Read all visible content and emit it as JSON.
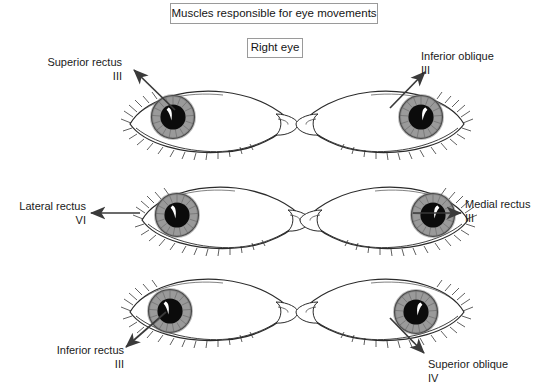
{
  "header": {
    "title": "Muscles responsible for eye movements",
    "subtitle": "Right eye"
  },
  "diagram": {
    "type": "anatomical-illustration",
    "subject": "right eye",
    "grid": {
      "rows": 3,
      "columns": 2
    },
    "panels": [
      {
        "id": "superior-rectus",
        "muscle": "Superior rectus",
        "nerve": "III",
        "direction": "up-left",
        "label_align": "right",
        "eye_orientation": "nasal-right",
        "gaze": "up-and-out"
      },
      {
        "id": "inferior-oblique",
        "muscle": "Inferior oblique",
        "nerve": "III",
        "direction": "up-right",
        "label_align": "left",
        "eye_orientation": "nasal-left",
        "gaze": "up-and-out"
      },
      {
        "id": "lateral-rectus",
        "muscle": "Lateral rectus",
        "nerve": "VI",
        "direction": "left",
        "label_align": "right",
        "eye_orientation": "nasal-right",
        "gaze": "out"
      },
      {
        "id": "medial-rectus",
        "muscle": "Medial rectus",
        "nerve": "III",
        "direction": "right",
        "label_align": "left",
        "eye_orientation": "nasal-left",
        "gaze": "in"
      },
      {
        "id": "inferior-rectus",
        "muscle": "Inferior rectus",
        "nerve": "III",
        "direction": "down-left",
        "label_align": "right",
        "eye_orientation": "nasal-right",
        "gaze": "down-and-out"
      },
      {
        "id": "superior-oblique",
        "muscle": "Superior oblique",
        "nerve": "IV",
        "direction": "down-right",
        "label_align": "left",
        "eye_orientation": "nasal-left",
        "gaze": "down-and-in"
      }
    ]
  },
  "colors": {
    "background": "#ffffff",
    "ink": "#1a1a1a",
    "outline": "#2b2b2b",
    "iris": "#9a9a9a",
    "iris_dark": "#7d7d7d",
    "pupil": "#0b0b0b",
    "highlight": "#ffffff",
    "box_border": "#9a9a9a",
    "arrow": "#3a3a3a"
  }
}
